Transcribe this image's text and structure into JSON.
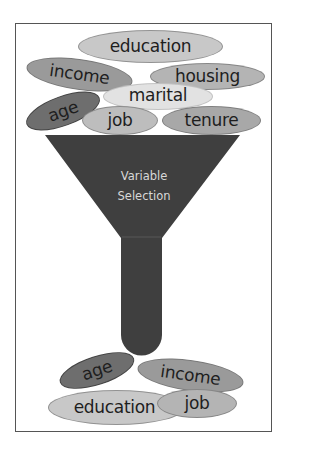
{
  "diagram": {
    "funnel": {
      "label_line1": "Variable",
      "label_line2": "Selection",
      "color": "#3f3f3f",
      "label_color": "#d8d8d8"
    },
    "input_variables": [
      {
        "label": "education",
        "color": "#c8c8c8"
      },
      {
        "label": "income",
        "color": "#9a9a9a"
      },
      {
        "label": "housing",
        "color": "#b4b4b4"
      },
      {
        "label": "marital",
        "color": "#e2e2e2"
      },
      {
        "label": "age",
        "color": "#6e6e6e"
      },
      {
        "label": "job",
        "color": "#bdbdbd"
      },
      {
        "label": "tenure",
        "color": "#a8a8a8"
      }
    ],
    "selected_variables": [
      {
        "label": "age",
        "color": "#6e6e6e"
      },
      {
        "label": "income",
        "color": "#9a9a9a"
      },
      {
        "label": "education",
        "color": "#c8c8c8"
      },
      {
        "label": "job",
        "color": "#b4b4b4"
      }
    ]
  }
}
